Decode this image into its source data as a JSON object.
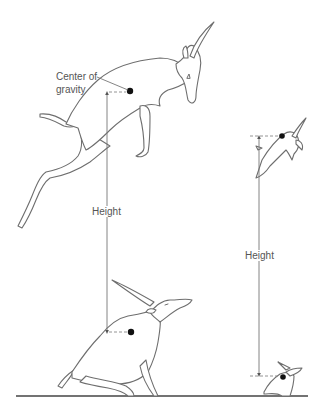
{
  "figure": {
    "labels": {
      "center_of_gravity_line1": "Center of",
      "center_of_gravity_line2": "gravity",
      "height_left": "Height",
      "height_right": "Height"
    },
    "subjects": [
      {
        "name": "large antelope",
        "poses": [
          "crouched",
          "airborne"
        ],
        "jump_height_px": 240
      },
      {
        "name": "small antelope",
        "poses": [
          "crouched",
          "airborne"
        ],
        "jump_height_px": 240
      }
    ],
    "colors": {
      "background": "#ffffff",
      "outline": "#6e6e6e",
      "cog_dot": "#111111",
      "label_text": "#555555",
      "ground": "#444444"
    }
  }
}
